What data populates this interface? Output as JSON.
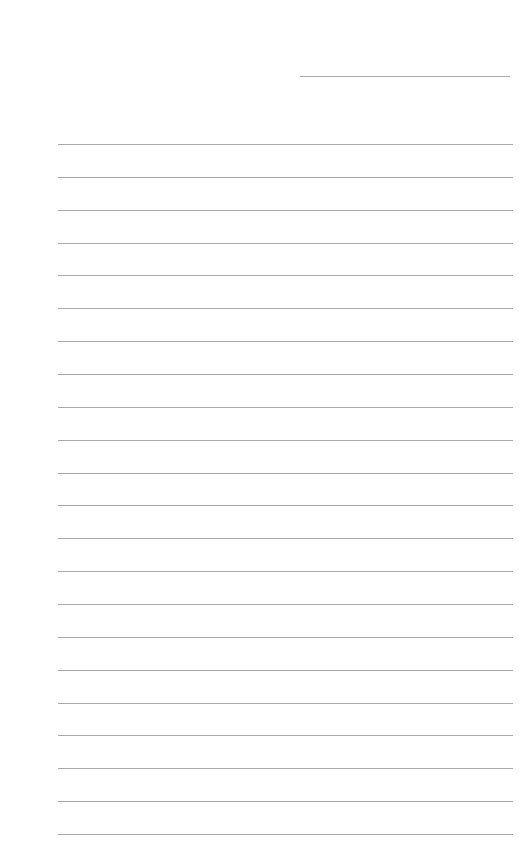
{
  "page": {
    "type": "lined-paper",
    "line_color": "#a8a8a8",
    "header_line": {
      "present": true
    },
    "ruled_lines": {
      "count": 22,
      "first_y": 144,
      "spacing": 32.86
    }
  }
}
